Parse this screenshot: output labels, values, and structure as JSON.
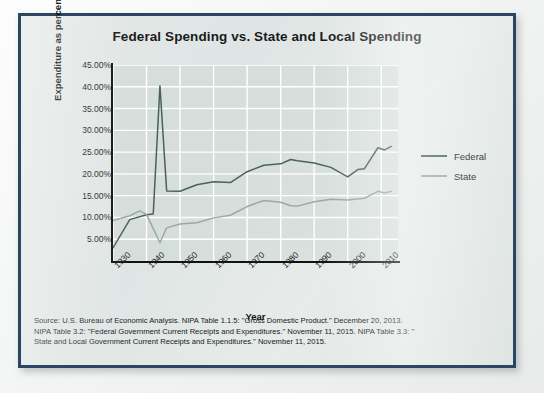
{
  "figure": {
    "title": "Federal Spending vs. State and Local Spending",
    "xlabel": "Year",
    "ylabel": "Expenditure as percent of GDP",
    "frame_color": "#2b4660",
    "plot_bg": "#ced7d4",
    "gridline_color": "#ffffff"
  },
  "legend": {
    "position": "right",
    "entries": [
      {
        "label": "Federal",
        "color": "#49625f"
      },
      {
        "label": "State",
        "color": "#9aa9a5"
      }
    ]
  },
  "source": {
    "lines": [
      "Source: U.S. Bureau of Economic Analysis. NIPA Table 1.1.5: \"Gross Domestic Product.\" December 20, 2013.",
      "NIPA Table 3.2: \"Federal Government Current Receipts and Expenditures.\" November 11, 2015. NIPA Table 3.3: \"",
      "State and Local Government Current Receipts and Expenditures.\" November 11, 2015."
    ]
  },
  "bleed_text": {
    "lines": [
      "and the state and local government spending",
      "reflects federal and local government",
      "of the spending that are",
      "as the chart below shows",
      "Attribution: Copy for introductory economics"
    ]
  },
  "chart_data": {
    "type": "line",
    "title": "Federal Spending vs. State and Local Spending",
    "xlabel": "Year",
    "ylabel": "Expenditure as percent of GDP",
    "xlim": [
      1930,
      2015
    ],
    "ylim": [
      0,
      45
    ],
    "xticks": [
      1930,
      1940,
      1950,
      1960,
      1970,
      1980,
      1990,
      2000,
      2010
    ],
    "xtick_labels": [
      "1930",
      "1940",
      "1950",
      "1960",
      "1970",
      "1980",
      "1990",
      "2000",
      "2010"
    ],
    "yticks": [
      5,
      10,
      15,
      20,
      25,
      30,
      35,
      40,
      45
    ],
    "ytick_labels": [
      "5.00%",
      "10.00%",
      "15.00%",
      "20.00%",
      "25.00%",
      "30.00%",
      "35.00%",
      "40.00%",
      "45.00%"
    ],
    "grid": true,
    "legend_position": "right",
    "series": [
      {
        "name": "Federal",
        "color": "#49625f",
        "x": [
          1930,
          1935,
          1940,
          1942,
          1944,
          1946,
          1950,
          1955,
          1960,
          1965,
          1970,
          1975,
          1980,
          1983,
          1985,
          1990,
          1995,
          2000,
          2003,
          2005,
          2009,
          2011,
          2013
        ],
        "values": [
          3.0,
          9.5,
          10.6,
          10.8,
          40.2,
          16.1,
          16.0,
          17.5,
          18.2,
          18.0,
          20.5,
          22.0,
          22.3,
          23.3,
          23.0,
          22.5,
          21.5,
          19.3,
          21.0,
          21.2,
          26.0,
          25.5,
          26.3
        ]
      },
      {
        "name": "State",
        "color": "#9aa9a5",
        "x": [
          1930,
          1935,
          1938,
          1940,
          1944,
          1946,
          1950,
          1955,
          1960,
          1965,
          1970,
          1975,
          1980,
          1983,
          1985,
          1990,
          1995,
          2000,
          2005,
          2009,
          2011,
          2013
        ],
        "values": [
          9.3,
          10.4,
          11.5,
          10.7,
          4.2,
          7.6,
          8.5,
          8.8,
          9.9,
          10.5,
          12.5,
          13.9,
          13.5,
          12.7,
          12.6,
          13.6,
          14.2,
          14.0,
          14.4,
          16.0,
          15.6,
          16.0
        ]
      }
    ],
    "annotations": [
      {
        "text": "World War II peak",
        "x": 1944,
        "y": 40.2,
        "series": "Federal",
        "visible": false
      }
    ]
  }
}
